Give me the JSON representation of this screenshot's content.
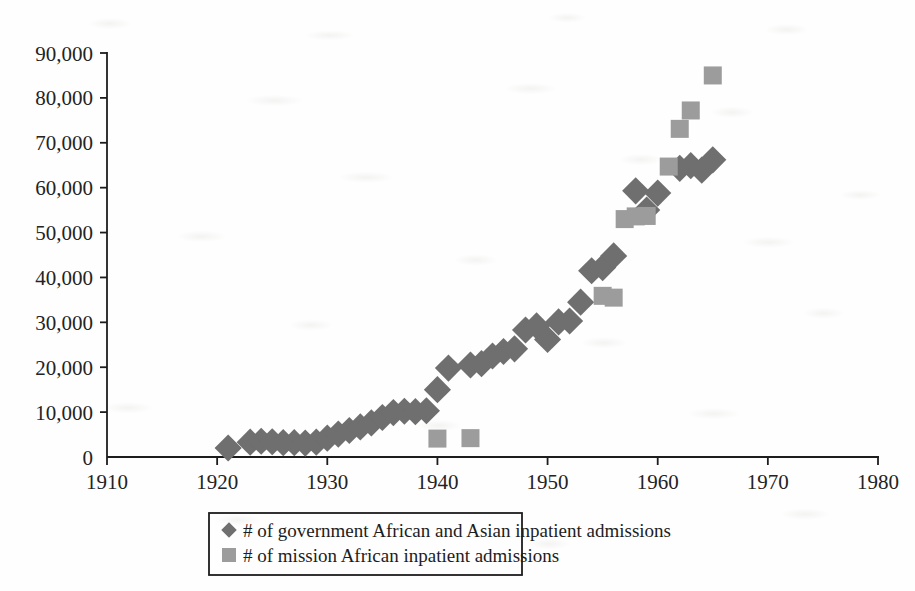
{
  "chart_data": {
    "type": "scatter",
    "title": "",
    "subtitle": "",
    "xlabel": "",
    "ylabel": "",
    "xlim": [
      1910,
      1980
    ],
    "ylim": [
      0,
      90000
    ],
    "xticks": [
      1910,
      1920,
      1930,
      1940,
      1950,
      1960,
      1970,
      1980
    ],
    "yticks": [
      0,
      10000,
      20000,
      30000,
      40000,
      50000,
      60000,
      70000,
      80000,
      90000
    ],
    "xtick_labels": [
      "1910",
      "1920",
      "1930",
      "1940",
      "1950",
      "1960",
      "1970",
      "1980"
    ],
    "ytick_labels": [
      "0",
      "10,000",
      "20,000",
      "30,000",
      "40,000",
      "50,000",
      "60,000",
      "70,000",
      "80,000",
      "90,000"
    ],
    "grid": false,
    "legend_position": "bottom",
    "series": [
      {
        "name": "# of government African and Asian inpatient admissions",
        "marker": "diamond",
        "color": "#6f6f6f",
        "points": [
          [
            1921,
            2000
          ],
          [
            1923,
            3300
          ],
          [
            1924,
            3500
          ],
          [
            1925,
            3400
          ],
          [
            1926,
            3200
          ],
          [
            1927,
            3200
          ],
          [
            1928,
            3100
          ],
          [
            1929,
            3300
          ],
          [
            1930,
            4200
          ],
          [
            1931,
            5100
          ],
          [
            1932,
            5900
          ],
          [
            1933,
            6700
          ],
          [
            1934,
            7600
          ],
          [
            1935,
            8800
          ],
          [
            1936,
            9900
          ],
          [
            1937,
            10200
          ],
          [
            1938,
            10100
          ],
          [
            1939,
            10300
          ],
          [
            1940,
            15000
          ],
          [
            1941,
            19800
          ],
          [
            1943,
            20500
          ],
          [
            1944,
            20800
          ],
          [
            1945,
            22500
          ],
          [
            1946,
            23500
          ],
          [
            1947,
            24100
          ],
          [
            1948,
            28300
          ],
          [
            1949,
            29200
          ],
          [
            1950,
            26200
          ],
          [
            1951,
            30100
          ],
          [
            1952,
            30300
          ],
          [
            1953,
            34500
          ],
          [
            1954,
            41500
          ],
          [
            1955,
            42200
          ],
          [
            1956,
            44800
          ],
          [
            1958,
            59300
          ],
          [
            1959,
            55000
          ],
          [
            1960,
            58800
          ],
          [
            1962,
            64300
          ],
          [
            1963,
            64900
          ],
          [
            1964,
            63900
          ],
          [
            1965,
            66200
          ]
        ]
      },
      {
        "name": "# of mission African inpatient admissions",
        "marker": "square",
        "color": "#9c9c9c",
        "points": [
          [
            1940,
            4100
          ],
          [
            1943,
            4200
          ],
          [
            1955,
            35900
          ],
          [
            1956,
            35500
          ],
          [
            1957,
            53000
          ],
          [
            1958,
            53600
          ],
          [
            1959,
            53700
          ],
          [
            1961,
            64700
          ],
          [
            1962,
            73100
          ],
          [
            1963,
            77200
          ],
          [
            1965,
            85000
          ]
        ]
      }
    ]
  },
  "legend": {
    "items": [
      {
        "marker": "diamond",
        "label": "# of government African and Asian inpatient admissions"
      },
      {
        "marker": "square",
        "label": "# of mission African inpatient admissions"
      }
    ]
  },
  "colors": {
    "government_marker": "#6f6f6f",
    "mission_marker": "#9c9c9c",
    "axis": "#1d1d1d",
    "text": "#1d1d1d",
    "background": "#fefefe"
  }
}
